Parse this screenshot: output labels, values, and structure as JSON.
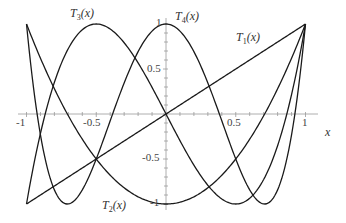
{
  "chart_data": {
    "type": "line",
    "title": "",
    "xlabel": "x",
    "ylabel": "",
    "xlim": [
      -1,
      1
    ],
    "ylim": [
      -1,
      1
    ],
    "grid": false,
    "x_ticks": [
      "-1",
      "-0.5",
      "0.5",
      "1"
    ],
    "y_ticks": [
      "1",
      "0.5",
      "-0.5",
      "-1"
    ],
    "series": [
      {
        "name": "T1(x)",
        "label_main": "T",
        "label_sub": "1",
        "label_arg": "(x)",
        "formula": "x",
        "x": [
          -1,
          -0.5,
          0,
          0.5,
          1
        ],
        "values": [
          -1,
          -0.5,
          0,
          0.5,
          1
        ]
      },
      {
        "name": "T2(x)",
        "label_main": "T",
        "label_sub": "2",
        "label_arg": "(x)",
        "formula": "2x^2-1",
        "x": [
          -1,
          -0.5,
          0,
          0.5,
          1
        ],
        "values": [
          1,
          -0.5,
          -1,
          -0.5,
          1
        ]
      },
      {
        "name": "T3(x)",
        "label_main": "T",
        "label_sub": "3",
        "label_arg": "(x)",
        "formula": "4x^3-3x",
        "x": [
          -1,
          -0.866,
          -0.5,
          0,
          0.5,
          0.866,
          1
        ],
        "values": [
          -1,
          0,
          1,
          0,
          -1,
          0,
          1
        ]
      },
      {
        "name": "T4(x)",
        "label_main": "T",
        "label_sub": "4",
        "label_arg": "(x)",
        "formula": "8x^4-8x^2+1",
        "x": [
          -1,
          -0.707,
          0,
          0.707,
          1
        ],
        "values": [
          1,
          -1,
          1,
          -1,
          1
        ]
      }
    ]
  }
}
